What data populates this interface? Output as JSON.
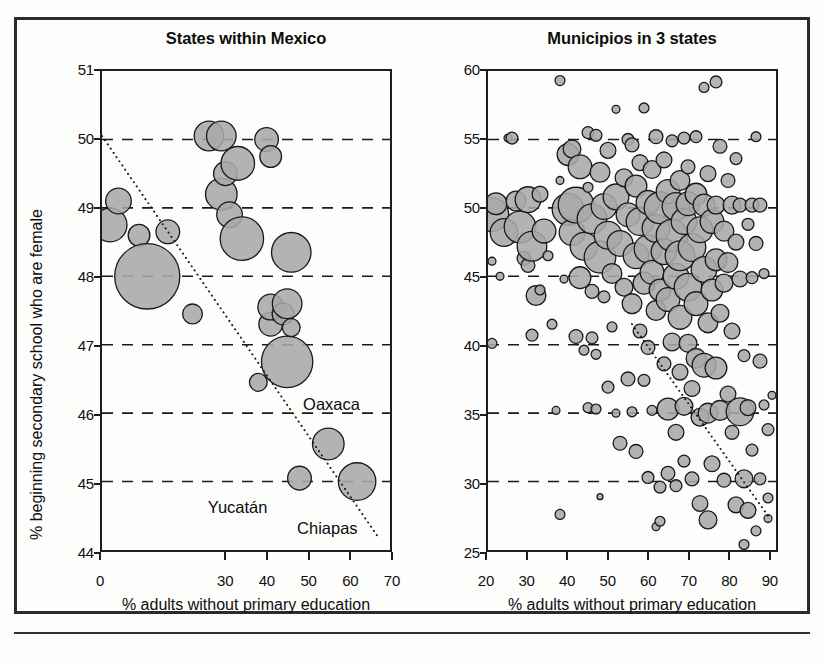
{
  "figure": {
    "background_color": "#fdfdfb",
    "frame_color": "#2b2b2b",
    "bubble_fill": "#a9a9a9",
    "bubble_stroke": "#1a1a1a",
    "gridline_color": "#1a1a1a",
    "trend_color": "#1a1a1a",
    "caption_fragment": ""
  },
  "chart_data": [
    {
      "id": "states-within-mexico",
      "type": "scatter",
      "title": "States within Mexico",
      "xlabel": "% adults without primary education",
      "ylabel": "% beginning secondary school who are female",
      "xlim": [
        0,
        70
      ],
      "ylim": [
        44,
        51
      ],
      "xticks": [
        0,
        30,
        40,
        50,
        60,
        70
      ],
      "xtick_labels": [
        "0",
        "30",
        "40",
        "50",
        "60",
        "70"
      ],
      "yticks": [
        44,
        45,
        46,
        47,
        48,
        49,
        50,
        51
      ],
      "ytick_labels": [
        "44",
        "45",
        "46",
        "47",
        "48",
        "49",
        "50",
        "51"
      ],
      "gridlines_y": [
        45,
        46,
        47,
        48,
        49,
        50
      ],
      "grid": "horizontal-dashed",
      "legend": "none",
      "bubble_size_meaning": "population",
      "trendline": {
        "style": "dotted",
        "x1": 0,
        "y1": 50.05,
        "x2": 67,
        "y2": 44.2
      },
      "points": [
        {
          "x": 2,
          "y": 48.75,
          "r": 17
        },
        {
          "x": 4,
          "y": 49.1,
          "r": 13
        },
        {
          "x": 9,
          "y": 48.6,
          "r": 11
        },
        {
          "x": 11,
          "y": 48.0,
          "r": 33
        },
        {
          "x": 16,
          "y": 48.65,
          "r": 12
        },
        {
          "x": 22,
          "y": 47.45,
          "r": 10
        },
        {
          "x": 26,
          "y": 50.05,
          "r": 15
        },
        {
          "x": 29,
          "y": 50.05,
          "r": 15
        },
        {
          "x": 29,
          "y": 49.2,
          "r": 16
        },
        {
          "x": 30,
          "y": 49.5,
          "r": 12
        },
        {
          "x": 31,
          "y": 48.9,
          "r": 13
        },
        {
          "x": 33,
          "y": 49.65,
          "r": 17
        },
        {
          "x": 34,
          "y": 48.55,
          "r": 22
        },
        {
          "x": 40,
          "y": 50.0,
          "r": 12
        },
        {
          "x": 41,
          "y": 49.75,
          "r": 11
        },
        {
          "x": 46,
          "y": 48.35,
          "r": 20
        },
        {
          "x": 38,
          "y": 46.45,
          "r": 9
        },
        {
          "x": 41,
          "y": 47.3,
          "r": 12
        },
        {
          "x": 41,
          "y": 47.55,
          "r": 13
        },
        {
          "x": 44,
          "y": 47.45,
          "r": 11
        },
        {
          "x": 45,
          "y": 47.6,
          "r": 15
        },
        {
          "x": 45,
          "y": 46.75,
          "r": 26
        },
        {
          "x": 46,
          "y": 47.25,
          "r": 9
        },
        {
          "x": 48,
          "y": 45.05,
          "r": 12
        },
        {
          "x": 55,
          "y": 45.55,
          "r": 16
        },
        {
          "x": 62,
          "y": 45.0,
          "r": 19
        }
      ],
      "annotations": [
        {
          "label": "Oaxaca",
          "x": 55.5,
          "y": 46.15
        },
        {
          "label": "Yucatán",
          "x": 33.0,
          "y": 44.65
        },
        {
          "label": "Chiapas",
          "x": 54.5,
          "y": 44.35
        }
      ]
    },
    {
      "id": "municipios-in-3-states",
      "type": "scatter",
      "title": "Municipios in 3 states",
      "xlabel": "% adults without primary education",
      "ylabel": "",
      "xlim": [
        20,
        92
      ],
      "ylim": [
        25,
        60
      ],
      "xticks": [
        20,
        30,
        40,
        50,
        60,
        70,
        80,
        90
      ],
      "xtick_labels": [
        "20",
        "30",
        "40",
        "50",
        "60",
        "70",
        "80",
        "90"
      ],
      "yticks": [
        25,
        30,
        35,
        40,
        45,
        50,
        55,
        60
      ],
      "ytick_labels": [
        "25",
        "30",
        "35",
        "40",
        "45",
        "50",
        "55",
        "60"
      ],
      "gridlines_y": [
        30,
        35,
        40,
        45,
        50,
        55
      ],
      "grid": "horizontal-dashed",
      "legend": "none",
      "bubble_size_meaning": "population",
      "trendline": {
        "style": "dotted",
        "x1": 56,
        "y1": 41.5,
        "x2": 90,
        "y2": 27.5
      },
      "cluster_summary": {
        "n_points": 430,
        "x_mode": 68,
        "y_mode": 47,
        "correlation": "negative"
      },
      "points": [
        {
          "x": 21,
          "y": 49.5,
          "r": 17
        },
        {
          "x": 22,
          "y": 50.3,
          "r": 11
        },
        {
          "x": 21,
          "y": 46.1,
          "r": 4
        },
        {
          "x": 23,
          "y": 45.0,
          "r": 4
        },
        {
          "x": 21,
          "y": 40.1,
          "r": 5
        },
        {
          "x": 24,
          "y": 48.2,
          "r": 14
        },
        {
          "x": 25,
          "y": 55.1,
          "r": 4
        },
        {
          "x": 26,
          "y": 55.1,
          "r": 6
        },
        {
          "x": 27,
          "y": 50.5,
          "r": 10
        },
        {
          "x": 28,
          "y": 48.6,
          "r": 16
        },
        {
          "x": 29,
          "y": 46.3,
          "r": 7
        },
        {
          "x": 30,
          "y": 45.8,
          "r": 7
        },
        {
          "x": 30,
          "y": 50.6,
          "r": 13
        },
        {
          "x": 31,
          "y": 40.7,
          "r": 6
        },
        {
          "x": 31,
          "y": 47.2,
          "r": 15
        },
        {
          "x": 32,
          "y": 43.6,
          "r": 10
        },
        {
          "x": 33,
          "y": 51.0,
          "r": 8
        },
        {
          "x": 33,
          "y": 44.0,
          "r": 5
        },
        {
          "x": 34,
          "y": 48.3,
          "r": 12
        },
        {
          "x": 35,
          "y": 46.5,
          "r": 5
        },
        {
          "x": 36,
          "y": 41.5,
          "r": 5
        },
        {
          "x": 37,
          "y": 35.2,
          "r": 4
        },
        {
          "x": 38,
          "y": 27.6,
          "r": 5
        },
        {
          "x": 38,
          "y": 59.3,
          "r": 5
        },
        {
          "x": 38,
          "y": 52.0,
          "r": 4
        },
        {
          "x": 39,
          "y": 44.8,
          "r": 4
        },
        {
          "x": 40,
          "y": 53.9,
          "r": 11
        },
        {
          "x": 40,
          "y": 49.9,
          "r": 16
        },
        {
          "x": 41,
          "y": 48.2,
          "r": 13
        },
        {
          "x": 41,
          "y": 54.3,
          "r": 9
        },
        {
          "x": 42,
          "y": 50.2,
          "r": 18
        },
        {
          "x": 42,
          "y": 40.6,
          "r": 7
        },
        {
          "x": 43,
          "y": 44.9,
          "r": 11
        },
        {
          "x": 43,
          "y": 53.0,
          "r": 12
        },
        {
          "x": 44,
          "y": 47.2,
          "r": 14
        },
        {
          "x": 44,
          "y": 39.6,
          "r": 5
        },
        {
          "x": 45,
          "y": 55.5,
          "r": 6
        },
        {
          "x": 45,
          "y": 51.5,
          "r": 5
        },
        {
          "x": 45,
          "y": 35.4,
          "r": 5
        },
        {
          "x": 46,
          "y": 49.2,
          "r": 15
        },
        {
          "x": 46,
          "y": 43.9,
          "r": 7
        },
        {
          "x": 46,
          "y": 40.5,
          "r": 6
        },
        {
          "x": 47,
          "y": 55.3,
          "r": 6
        },
        {
          "x": 47,
          "y": 35.3,
          "r": 5
        },
        {
          "x": 47,
          "y": 39.3,
          "r": 5
        },
        {
          "x": 48,
          "y": 52.6,
          "r": 10
        },
        {
          "x": 48,
          "y": 28.9,
          "r": 3
        },
        {
          "x": 48,
          "y": 46.4,
          "r": 16
        },
        {
          "x": 49,
          "y": 50.1,
          "r": 13
        },
        {
          "x": 49,
          "y": 43.5,
          "r": 6
        },
        {
          "x": 50,
          "y": 54.2,
          "r": 8
        },
        {
          "x": 50,
          "y": 48.0,
          "r": 14
        },
        {
          "x": 50,
          "y": 36.9,
          "r": 6
        },
        {
          "x": 51,
          "y": 45.2,
          "r": 10
        },
        {
          "x": 51,
          "y": 41.3,
          "r": 5
        },
        {
          "x": 52,
          "y": 50.8,
          "r": 13
        },
        {
          "x": 52,
          "y": 57.2,
          "r": 4
        },
        {
          "x": 52,
          "y": 35.0,
          "r": 4
        },
        {
          "x": 53,
          "y": 47.4,
          "r": 13
        },
        {
          "x": 53,
          "y": 32.8,
          "r": 7
        },
        {
          "x": 54,
          "y": 52.2,
          "r": 9
        },
        {
          "x": 54,
          "y": 44.2,
          "r": 9
        },
        {
          "x": 55,
          "y": 55.0,
          "r": 6
        },
        {
          "x": 55,
          "y": 37.5,
          "r": 7
        },
        {
          "x": 55,
          "y": 49.5,
          "r": 12
        },
        {
          "x": 56,
          "y": 43.0,
          "r": 10
        },
        {
          "x": 56,
          "y": 54.6,
          "r": 7
        },
        {
          "x": 56,
          "y": 35.1,
          "r": 5
        },
        {
          "x": 57,
          "y": 51.6,
          "r": 11
        },
        {
          "x": 57,
          "y": 46.5,
          "r": 13
        },
        {
          "x": 57,
          "y": 32.2,
          "r": 7
        },
        {
          "x": 58,
          "y": 49.0,
          "r": 14
        },
        {
          "x": 58,
          "y": 41.0,
          "r": 7
        },
        {
          "x": 58,
          "y": 53.3,
          "r": 8
        },
        {
          "x": 59,
          "y": 44.5,
          "r": 11
        },
        {
          "x": 59,
          "y": 37.4,
          "r": 6
        },
        {
          "x": 59,
          "y": 57.3,
          "r": 5
        },
        {
          "x": 60,
          "y": 50.4,
          "r": 12
        },
        {
          "x": 60,
          "y": 47.0,
          "r": 14
        },
        {
          "x": 60,
          "y": 39.8,
          "r": 7
        },
        {
          "x": 60,
          "y": 30.3,
          "r": 6
        },
        {
          "x": 61,
          "y": 52.8,
          "r": 9
        },
        {
          "x": 61,
          "y": 45.3,
          "r": 12
        },
        {
          "x": 61,
          "y": 35.2,
          "r": 5
        },
        {
          "x": 62,
          "y": 48.5,
          "r": 14
        },
        {
          "x": 62,
          "y": 42.5,
          "r": 10
        },
        {
          "x": 62,
          "y": 55.2,
          "r": 7
        },
        {
          "x": 62,
          "y": 26.7,
          "r": 4
        },
        {
          "x": 63,
          "y": 50.0,
          "r": 16
        },
        {
          "x": 63,
          "y": 44.0,
          "r": 11
        },
        {
          "x": 63,
          "y": 29.6,
          "r": 6
        },
        {
          "x": 63,
          "y": 27.1,
          "r": 5
        },
        {
          "x": 64,
          "y": 46.8,
          "r": 13
        },
        {
          "x": 64,
          "y": 38.6,
          "r": 7
        },
        {
          "x": 64,
          "y": 53.5,
          "r": 8
        },
        {
          "x": 65,
          "y": 51.2,
          "r": 12
        },
        {
          "x": 65,
          "y": 43.3,
          "r": 12
        },
        {
          "x": 65,
          "y": 35.3,
          "r": 11
        },
        {
          "x": 65,
          "y": 30.6,
          "r": 7
        },
        {
          "x": 66,
          "y": 48.0,
          "r": 16
        },
        {
          "x": 66,
          "y": 40.2,
          "r": 9
        },
        {
          "x": 66,
          "y": 54.9,
          "r": 6
        },
        {
          "x": 67,
          "y": 50.1,
          "r": 14
        },
        {
          "x": 67,
          "y": 45.0,
          "r": 13
        },
        {
          "x": 67,
          "y": 33.6,
          "r": 8
        },
        {
          "x": 67,
          "y": 29.7,
          "r": 6
        },
        {
          "x": 68,
          "y": 52.0,
          "r": 10
        },
        {
          "x": 68,
          "y": 46.5,
          "r": 15
        },
        {
          "x": 68,
          "y": 38.0,
          "r": 8
        },
        {
          "x": 68,
          "y": 42.0,
          "r": 12
        },
        {
          "x": 69,
          "y": 49.0,
          "r": 13
        },
        {
          "x": 69,
          "y": 35.5,
          "r": 9
        },
        {
          "x": 69,
          "y": 55.1,
          "r": 6
        },
        {
          "x": 69,
          "y": 31.5,
          "r": 6
        },
        {
          "x": 70,
          "y": 50.3,
          "r": 12
        },
        {
          "x": 70,
          "y": 44.2,
          "r": 14
        },
        {
          "x": 70,
          "y": 40.1,
          "r": 9
        },
        {
          "x": 70,
          "y": 53.0,
          "r": 7
        },
        {
          "x": 71,
          "y": 47.1,
          "r": 14
        },
        {
          "x": 71,
          "y": 36.8,
          "r": 8
        },
        {
          "x": 71,
          "y": 30.2,
          "r": 7
        },
        {
          "x": 72,
          "y": 51.0,
          "r": 11
        },
        {
          "x": 72,
          "y": 43.0,
          "r": 12
        },
        {
          "x": 72,
          "y": 39.0,
          "r": 10
        },
        {
          "x": 72,
          "y": 55.2,
          "r": 6
        },
        {
          "x": 73,
          "y": 48.4,
          "r": 13
        },
        {
          "x": 73,
          "y": 34.7,
          "r": 9
        },
        {
          "x": 73,
          "y": 28.4,
          "r": 8
        },
        {
          "x": 74,
          "y": 50.2,
          "r": 11
        },
        {
          "x": 74,
          "y": 45.5,
          "r": 13
        },
        {
          "x": 74,
          "y": 38.5,
          "r": 12
        },
        {
          "x": 74,
          "y": 58.8,
          "r": 5
        },
        {
          "x": 75,
          "y": 52.5,
          "r": 8
        },
        {
          "x": 75,
          "y": 41.6,
          "r": 10
        },
        {
          "x": 75,
          "y": 35.0,
          "r": 10
        },
        {
          "x": 75,
          "y": 27.2,
          "r": 9
        },
        {
          "x": 76,
          "y": 49.0,
          "r": 12
        },
        {
          "x": 76,
          "y": 44.0,
          "r": 11
        },
        {
          "x": 76,
          "y": 31.3,
          "r": 8
        },
        {
          "x": 77,
          "y": 50.2,
          "r": 9
        },
        {
          "x": 77,
          "y": 46.2,
          "r": 11
        },
        {
          "x": 77,
          "y": 38.3,
          "r": 11
        },
        {
          "x": 77,
          "y": 59.2,
          "r": 6
        },
        {
          "x": 78,
          "y": 54.5,
          "r": 7
        },
        {
          "x": 78,
          "y": 42.3,
          "r": 9
        },
        {
          "x": 78,
          "y": 35.2,
          "r": 10
        },
        {
          "x": 79,
          "y": 48.3,
          "r": 10
        },
        {
          "x": 79,
          "y": 30.1,
          "r": 7
        },
        {
          "x": 79,
          "y": 44.5,
          "r": 9
        },
        {
          "x": 80,
          "y": 52.0,
          "r": 7
        },
        {
          "x": 80,
          "y": 46.0,
          "r": 10
        },
        {
          "x": 80,
          "y": 36.4,
          "r": 8
        },
        {
          "x": 81,
          "y": 50.2,
          "r": 9
        },
        {
          "x": 81,
          "y": 41.0,
          "r": 8
        },
        {
          "x": 81,
          "y": 33.6,
          "r": 7
        },
        {
          "x": 82,
          "y": 47.5,
          "r": 8
        },
        {
          "x": 82,
          "y": 28.3,
          "r": 8
        },
        {
          "x": 82,
          "y": 53.6,
          "r": 6
        },
        {
          "x": 83,
          "y": 50.2,
          "r": 7
        },
        {
          "x": 83,
          "y": 35.1,
          "r": 14
        },
        {
          "x": 83,
          "y": 44.8,
          "r": 8
        },
        {
          "x": 84,
          "y": 30.2,
          "r": 9
        },
        {
          "x": 84,
          "y": 25.4,
          "r": 5
        },
        {
          "x": 84,
          "y": 39.2,
          "r": 6
        },
        {
          "x": 85,
          "y": 48.8,
          "r": 6
        },
        {
          "x": 85,
          "y": 35.4,
          "r": 8
        },
        {
          "x": 85,
          "y": 27.9,
          "r": 8
        },
        {
          "x": 86,
          "y": 50.2,
          "r": 7
        },
        {
          "x": 86,
          "y": 44.9,
          "r": 6
        },
        {
          "x": 86,
          "y": 32.3,
          "r": 6
        },
        {
          "x": 87,
          "y": 55.2,
          "r": 5
        },
        {
          "x": 87,
          "y": 47.4,
          "r": 7
        },
        {
          "x": 87,
          "y": 26.4,
          "r": 5
        },
        {
          "x": 88,
          "y": 50.2,
          "r": 7
        },
        {
          "x": 88,
          "y": 38.8,
          "r": 7
        },
        {
          "x": 88,
          "y": 30.2,
          "r": 6
        },
        {
          "x": 89,
          "y": 35.6,
          "r": 5
        },
        {
          "x": 89,
          "y": 45.2,
          "r": 5
        },
        {
          "x": 90,
          "y": 33.8,
          "r": 6
        },
        {
          "x": 90,
          "y": 28.8,
          "r": 5
        },
        {
          "x": 90,
          "y": 27.3,
          "r": 4
        },
        {
          "x": 91,
          "y": 36.3,
          "r": 4
        }
      ]
    }
  ]
}
